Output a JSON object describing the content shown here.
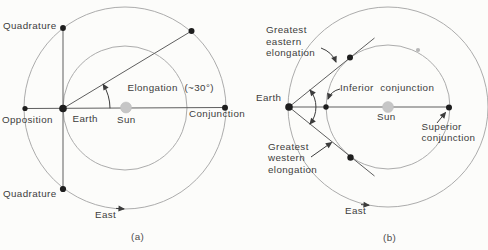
{
  "figure": {
    "colors": {
      "background": "#fcfcfa",
      "orbit_stroke": "#acacac",
      "line_stroke": "#5e5e5e",
      "dot_fill": "#1e1e1e",
      "sun_fill": "#c6c6c6",
      "text_color": "#3c3c3c"
    },
    "diagram_a": {
      "caption": "(a)",
      "labels": {
        "quadrature_top": "Quadrature",
        "opposition": "Opposition",
        "earth": "Earth",
        "sun": "Sun",
        "conjunction": "Conjunction",
        "elongation": "Elongation (~30°)",
        "quadrature_bottom": "Quadrature",
        "east": "East"
      }
    },
    "diagram_b": {
      "caption": "(b)",
      "labels": {
        "greatest_eastern": [
          "Greatest",
          "eastern",
          "elongation"
        ],
        "earth": "Earth",
        "inferior_conjunction": "Inferior conjunction",
        "sun": "Sun",
        "superior_conjunction": [
          "Superior",
          "conjunction"
        ],
        "greatest_western": [
          "Greatest",
          "western",
          "elongation"
        ],
        "east": "East"
      }
    }
  }
}
